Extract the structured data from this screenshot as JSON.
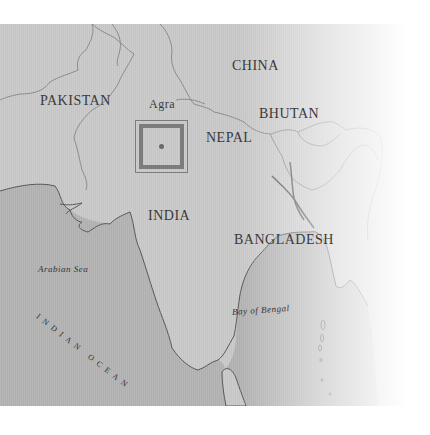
{
  "map": {
    "countries": {
      "pakistan": "PAKISTAN",
      "china": "CHINA",
      "bhutan": "BHUTAN",
      "nepal": "NEPAL",
      "india": "INDIA",
      "bangladesh": "BANGLADESH"
    },
    "cities": {
      "agra": "Agra"
    },
    "water": {
      "arabian_sea": "Arabian Sea",
      "bay_of_bengal": "Bay of Bengal",
      "indian_ocean": "INDIAN OCEAN"
    },
    "marker": {
      "location": "Agra",
      "shape": "double-square-with-dot"
    },
    "colors": {
      "land": "#c9c9c9",
      "sea": "#b3b3b3",
      "border": "#8a8a8a",
      "coastline": "#555555",
      "marker": "#7c7c7c",
      "label": "#3a3a3a"
    }
  }
}
